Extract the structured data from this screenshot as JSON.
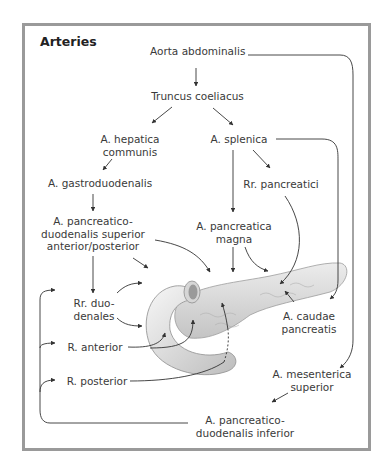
{
  "figure": {
    "title": "Arteries",
    "labels": {
      "aorta": "Aorta abdominalis",
      "truncus": "Truncus coeliacus",
      "hepatica_1": "A. hepatica",
      "hepatica_2": "communis",
      "splenica": "A. splenica",
      "gastroduodenalis": "A. gastroduodenalis",
      "rr_pancreatici": "Rr. pancreatici",
      "pds_1": "A. pancreatico-",
      "pds_2": "duodenalis superior",
      "pds_3": "anterior/posterior",
      "magna_1": "A. pancreatica",
      "magna_2": "magna",
      "rr_duo_1": "Rr. duo-",
      "rr_duo_2": "denales",
      "r_anterior": "R. anterior",
      "r_posterior": "R. posterior",
      "caudae_1": "A. caudae",
      "caudae_2": "pancreatis",
      "mesenterica_1": "A. mesenterica",
      "mesenterica_2": "superior",
      "pdi_1": "A. pancreatico-",
      "pdi_2": "duodenalis inferior"
    },
    "colors": {
      "frame": "#9a9a9a",
      "line": "#333333",
      "organ": "#e6e6e6",
      "organ_shadow": "#b8b8b8"
    }
  }
}
